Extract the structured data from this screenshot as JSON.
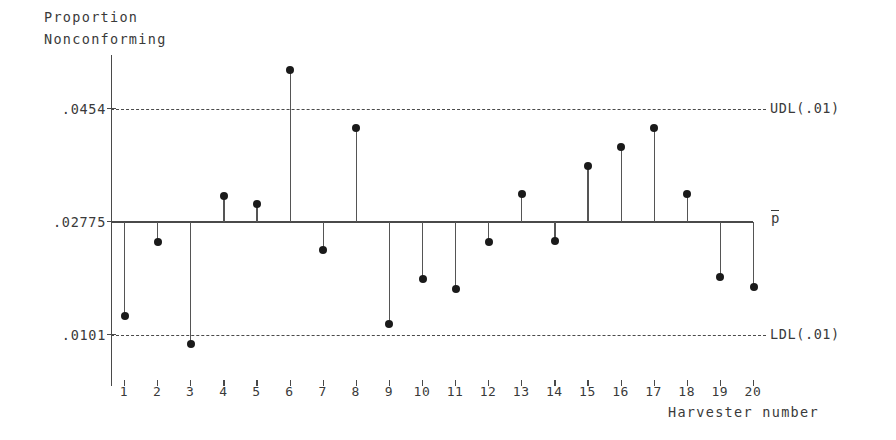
{
  "chart_data": {
    "type": "scatter",
    "title": "",
    "ylabel": "Proportion\nNonconforming",
    "xlabel": "Harvester number",
    "categories": [
      1,
      2,
      3,
      4,
      5,
      6,
      7,
      8,
      9,
      10,
      11,
      12,
      13,
      14,
      15,
      16,
      17,
      18,
      19,
      20
    ],
    "values": [
      0.013,
      0.0247,
      0.0087,
      0.0318,
      0.0306,
      0.0515,
      0.0233,
      0.0424,
      0.0118,
      0.0189,
      0.0173,
      0.0247,
      0.0321,
      0.0248,
      0.0365,
      0.0394,
      0.0425,
      0.0321,
      0.0192,
      0.0176
    ],
    "ylim": [
      0.005,
      0.056
    ],
    "xlim": [
      0.3,
      20.7
    ],
    "grid": false,
    "legend_position": "right-inline",
    "ytick_labels": [
      ".0454",
      ".02775",
      ".0101"
    ],
    "ytick_values": [
      0.0454,
      0.02775,
      0.0101
    ],
    "reference_lines": [
      {
        "name": "upper-decision-limit",
        "label": "UDL(.01)",
        "value": 0.0454,
        "style": "dashed"
      },
      {
        "name": "center-line",
        "label": "p̄",
        "value": 0.02775,
        "style": "solid"
      },
      {
        "name": "lower-decision-limit",
        "label": "LDL(.01)",
        "value": 0.0101,
        "style": "dashed"
      }
    ],
    "out_of_control_points": [
      {
        "harvester": 3,
        "value": 0.0087,
        "side": "below"
      },
      {
        "harvester": 6,
        "value": 0.0515,
        "side": "above"
      }
    ]
  },
  "axes": {
    "y_title_line1": "Proportion",
    "y_title_line2": "Nonconforming",
    "x_title": "Harvester number",
    "y_tick_0": ".0454",
    "y_tick_1": ".02775",
    "y_tick_2": ".0101",
    "x_ticks": [
      "1",
      "2",
      "3",
      "4",
      "5",
      "6",
      "7",
      "8",
      "9",
      "10",
      "11",
      "12",
      "13",
      "14",
      "15",
      "16",
      "17",
      "18",
      "19",
      "20"
    ]
  },
  "limits": {
    "udl_label": "UDL(.01)",
    "ldl_label": "LDL(.01)",
    "center_label": "p"
  },
  "colors": {
    "ink": "#2b2b2b",
    "axis": "#4a4a4a",
    "marker": "#1a1a1a",
    "background": "#ffffff"
  }
}
